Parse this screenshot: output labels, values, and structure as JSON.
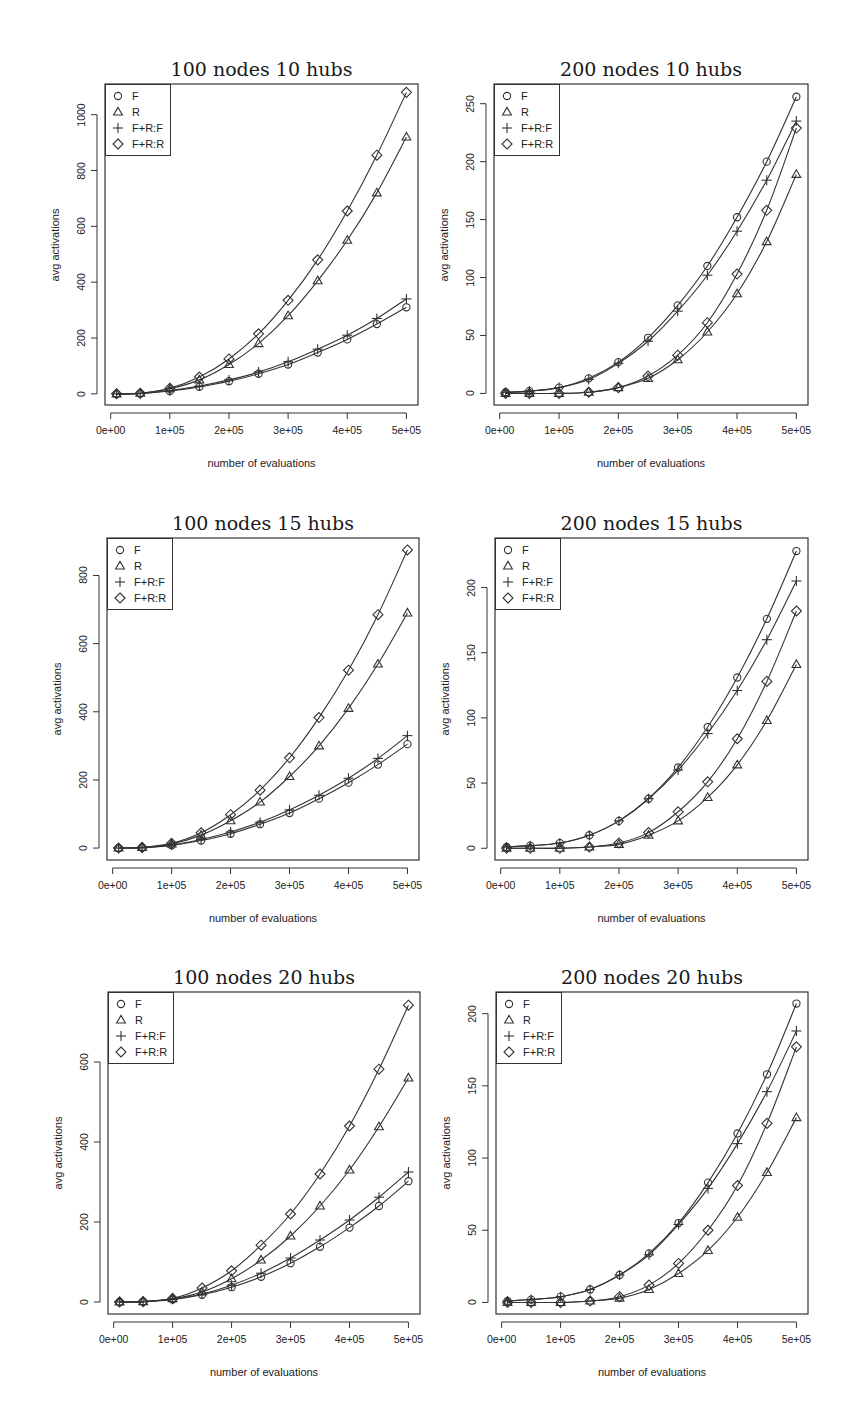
{
  "figure": {
    "legend": [
      {
        "label": "F",
        "symbol": "circle"
      },
      {
        "label": "R",
        "symbol": "triangle"
      },
      {
        "label": "F+R:F",
        "symbol": "plus"
      },
      {
        "label": "F+R:R",
        "symbol": "diamond"
      }
    ],
    "xlabel": "number of evaluations",
    "ylabel": "avg activations",
    "x_tick_labels": [
      "0e+00",
      "1e+05",
      "2e+05",
      "3e+05",
      "4e+05",
      "5e+05"
    ]
  },
  "chart_data": [
    {
      "type": "line",
      "title": "100 nodes 10 hubs",
      "xlabel": "number of evaluations",
      "ylabel": "avg activations",
      "x": [
        10000,
        50000,
        100000,
        150000,
        200000,
        250000,
        300000,
        350000,
        400000,
        450000,
        500000
      ],
      "xlim": [
        0,
        500000
      ],
      "ylim": [
        -40,
        1110
      ],
      "y_ticks": [
        0,
        200,
        400,
        600,
        800,
        1000
      ],
      "legend_position": "topleft",
      "grid": false,
      "series": [
        {
          "name": "F",
          "marker": "circle",
          "values": [
            0,
            1,
            10,
            25,
            45,
            72,
            105,
            148,
            195,
            250,
            310
          ]
        },
        {
          "name": "R",
          "marker": "triangle",
          "values": [
            0,
            2,
            18,
            50,
            105,
            180,
            280,
            405,
            550,
            720,
            920
          ]
        },
        {
          "name": "F+R:F",
          "marker": "plus",
          "values": [
            0,
            1,
            12,
            28,
            50,
            78,
            115,
            160,
            210,
            270,
            340
          ]
        },
        {
          "name": "F+R:R",
          "marker": "diamond",
          "values": [
            0,
            2,
            20,
            60,
            125,
            215,
            335,
            480,
            655,
            855,
            1080
          ]
        }
      ]
    },
    {
      "type": "line",
      "title": "200 nodes 10 hubs",
      "xlabel": "number of evaluations",
      "ylabel": "avg activations",
      "x": [
        10000,
        50000,
        100000,
        150000,
        200000,
        250000,
        300000,
        350000,
        400000,
        450000,
        500000
      ],
      "xlim": [
        0,
        500000
      ],
      "ylim": [
        -10,
        267
      ],
      "y_ticks": [
        0,
        50,
        100,
        150,
        200,
        250
      ],
      "legend_position": "topleft",
      "grid": false,
      "series": [
        {
          "name": "F",
          "marker": "circle",
          "values": [
            1,
            2,
            5,
            13,
            27,
            48,
            76,
            110,
            152,
            200,
            256
          ]
        },
        {
          "name": "R",
          "marker": "triangle",
          "values": [
            0,
            0,
            0,
            1,
            5,
            13,
            29,
            53,
            86,
            131,
            189
          ]
        },
        {
          "name": "F+R:F",
          "marker": "plus",
          "values": [
            1,
            2,
            5,
            12,
            26,
            45,
            71,
            102,
            140,
            184,
            235
          ]
        },
        {
          "name": "F+R:R",
          "marker": "diamond",
          "values": [
            0,
            0,
            0,
            1,
            5,
            15,
            33,
            61,
            103,
            158,
            229
          ]
        }
      ]
    },
    {
      "type": "line",
      "title": "100 nodes 15 hubs",
      "xlabel": "number of evaluations",
      "ylabel": "avg activations",
      "x": [
        10000,
        50000,
        100000,
        150000,
        200000,
        250000,
        300000,
        350000,
        400000,
        450000,
        500000
      ],
      "xlim": [
        0,
        500000
      ],
      "ylim": [
        -35,
        910
      ],
      "y_ticks": [
        0,
        200,
        400,
        600,
        800
      ],
      "legend_position": "topleft",
      "grid": false,
      "series": [
        {
          "name": "F",
          "marker": "circle",
          "values": [
            0,
            1,
            8,
            22,
            42,
            70,
            103,
            145,
            192,
            245,
            305
          ]
        },
        {
          "name": "R",
          "marker": "triangle",
          "values": [
            0,
            2,
            12,
            38,
            80,
            135,
            210,
            300,
            410,
            540,
            690
          ]
        },
        {
          "name": "F+R:F",
          "marker": "plus",
          "values": [
            0,
            1,
            9,
            25,
            47,
            76,
            112,
            155,
            205,
            263,
            330
          ]
        },
        {
          "name": "F+R:R",
          "marker": "diamond",
          "values": [
            0,
            2,
            14,
            45,
            98,
            170,
            265,
            383,
            522,
            685,
            875
          ]
        }
      ]
    },
    {
      "type": "line",
      "title": "200 nodes 15 hubs",
      "xlabel": "number of evaluations",
      "ylabel": "avg activations",
      "x": [
        10000,
        50000,
        100000,
        150000,
        200000,
        250000,
        300000,
        350000,
        400000,
        450000,
        500000
      ],
      "xlim": [
        0,
        500000
      ],
      "ylim": [
        -9,
        238
      ],
      "y_ticks": [
        0,
        50,
        100,
        150,
        200
      ],
      "legend_position": "topleft",
      "grid": false,
      "series": [
        {
          "name": "F",
          "marker": "circle",
          "values": [
            1,
            2,
            4,
            10,
            21,
            38,
            62,
            93,
            131,
            176,
            228
          ]
        },
        {
          "name": "R",
          "marker": "triangle",
          "values": [
            0,
            0,
            0,
            1,
            3,
            10,
            21,
            39,
            64,
            98,
            141
          ]
        },
        {
          "name": "F+R:F",
          "marker": "plus",
          "values": [
            1,
            2,
            4,
            10,
            21,
            38,
            60,
            88,
            121,
            160,
            205
          ]
        },
        {
          "name": "F+R:R",
          "marker": "diamond",
          "values": [
            0,
            0,
            0,
            1,
            4,
            12,
            28,
            51,
            84,
            128,
            182
          ]
        }
      ]
    },
    {
      "type": "line",
      "title": "100 nodes 20 hubs",
      "xlabel": "number of evaluations",
      "ylabel": "avg activations",
      "x": [
        10000,
        50000,
        100000,
        150000,
        200000,
        250000,
        300000,
        350000,
        400000,
        450000,
        500000
      ],
      "xlim": [
        0,
        500000
      ],
      "ylim": [
        -30,
        775
      ],
      "y_ticks": [
        0,
        200,
        400,
        600
      ],
      "legend_position": "topleft",
      "grid": false,
      "series": [
        {
          "name": "F",
          "marker": "circle",
          "values": [
            0,
            1,
            6,
            18,
            37,
            63,
            97,
            138,
            186,
            240,
            302
          ]
        },
        {
          "name": "R",
          "marker": "triangle",
          "values": [
            0,
            1,
            8,
            25,
            58,
            105,
            165,
            240,
            330,
            438,
            560
          ]
        },
        {
          "name": "F+R:F",
          "marker": "plus",
          "values": [
            0,
            1,
            7,
            20,
            42,
            72,
            110,
            155,
            205,
            262,
            325
          ]
        },
        {
          "name": "F+R:R",
          "marker": "diamond",
          "values": [
            0,
            1,
            9,
            35,
            78,
            142,
            220,
            320,
            440,
            582,
            742
          ]
        }
      ]
    },
    {
      "type": "line",
      "title": "200 nodes 20 hubs",
      "xlabel": "number of evaluations",
      "ylabel": "avg activations",
      "x": [
        10000,
        50000,
        100000,
        150000,
        200000,
        250000,
        300000,
        350000,
        400000,
        450000,
        500000
      ],
      "xlim": [
        0,
        500000
      ],
      "ylim": [
        -8,
        215
      ],
      "y_ticks": [
        0,
        50,
        100,
        150,
        200
      ],
      "legend_position": "topleft",
      "grid": false,
      "series": [
        {
          "name": "F",
          "marker": "circle",
          "values": [
            1,
            2,
            4,
            9,
            19,
            34,
            55,
            83,
            117,
            158,
            207
          ]
        },
        {
          "name": "R",
          "marker": "triangle",
          "values": [
            0,
            0,
            0,
            1,
            3,
            9,
            20,
            36,
            59,
            90,
            128
          ]
        },
        {
          "name": "F+R:F",
          "marker": "plus",
          "values": [
            1,
            2,
            4,
            9,
            19,
            33,
            54,
            79,
            110,
            146,
            188
          ]
        },
        {
          "name": "F+R:R",
          "marker": "diamond",
          "values": [
            0,
            0,
            0,
            1,
            4,
            12,
            27,
            50,
            81,
            124,
            177
          ]
        }
      ]
    }
  ]
}
